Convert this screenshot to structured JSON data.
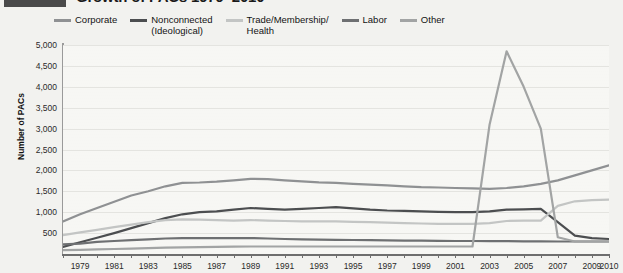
{
  "title_badge_label": "",
  "header": {
    "title": "Growth of PACs 1979–2010"
  },
  "legend": {
    "position": "top",
    "items": [
      {
        "label": "Corporate",
        "color": "#8f9193"
      },
      {
        "label": "Nonconnected\n(Ideological)",
        "color": "#4c4e50"
      },
      {
        "label": "Trade/Membership/\nHealth",
        "color": "#c3c5c4"
      },
      {
        "label": "Labor",
        "color": "#6e7072"
      },
      {
        "label": "Other",
        "color": "#a2a4a4"
      }
    ]
  },
  "chart_data": {
    "type": "line",
    "title": "Growth of PACs 1979–2010",
    "xlabel": "",
    "ylabel": "Number of PACs",
    "ylim": [
      0,
      5000
    ],
    "ytick_step": 500,
    "yticks": [
      500,
      1000,
      1500,
      2000,
      2500,
      3000,
      3500,
      4000,
      4500,
      5000
    ],
    "ytick_labels": [
      "500",
      "1,000",
      "1,500",
      "2,000",
      "2,500",
      "3,000",
      "3,500",
      "4,000",
      "4,500",
      "5,000"
    ],
    "grid": true,
    "legend_position": "top",
    "x": [
      1978,
      1979,
      1980,
      1981,
      1982,
      1983,
      1984,
      1985,
      1986,
      1987,
      1988,
      1989,
      1990,
      1991,
      1992,
      1993,
      1994,
      1995,
      1996,
      1997,
      1998,
      1999,
      2000,
      2001,
      2002,
      2003,
      2004,
      2005,
      2006,
      2007,
      2008,
      2009,
      2010
    ],
    "xtick_labels": [
      "1979",
      "1981",
      "1983",
      "1985",
      "1987",
      "1989",
      "1991",
      "1993",
      "1995",
      "1997",
      "1999",
      "2001",
      "2003",
      "2005",
      "2007",
      "2009",
      "2010"
    ],
    "xtick_values": [
      1979,
      1981,
      1983,
      1985,
      1987,
      1989,
      1991,
      1993,
      1995,
      1997,
      1999,
      2001,
      2003,
      2005,
      2007,
      2009,
      2010
    ],
    "series": [
      {
        "name": "Corporate",
        "color": "#8f9193",
        "values": [
          780,
          950,
          1100,
          1250,
          1400,
          1500,
          1620,
          1700,
          1710,
          1730,
          1760,
          1800,
          1790,
          1760,
          1740,
          1715,
          1700,
          1680,
          1660,
          1640,
          1620,
          1600,
          1590,
          1580,
          1570,
          1560,
          1580,
          1620,
          1680,
          1760,
          1880,
          2000,
          2120
        ]
      },
      {
        "name": "Nonconnected (Ideological)",
        "color": "#4c4e50",
        "values": [
          170,
          280,
          390,
          500,
          620,
          740,
          860,
          950,
          1000,
          1020,
          1060,
          1100,
          1080,
          1060,
          1080,
          1100,
          1120,
          1090,
          1060,
          1040,
          1030,
          1020,
          1010,
          1000,
          1000,
          1020,
          1060,
          1070,
          1080,
          760,
          440,
          380,
          360
        ]
      },
      {
        "name": "Trade/Membership/Health",
        "color": "#c3c5c4",
        "values": [
          450,
          520,
          580,
          640,
          700,
          760,
          810,
          830,
          820,
          810,
          800,
          810,
          800,
          790,
          780,
          780,
          780,
          770,
          760,
          750,
          740,
          730,
          720,
          720,
          720,
          740,
          790,
          800,
          800,
          1150,
          1260,
          1290,
          1300
        ]
      },
      {
        "name": "Labor",
        "color": "#6e7072",
        "values": [
          230,
          250,
          290,
          310,
          330,
          350,
          370,
          380,
          380,
          380,
          380,
          380,
          370,
          360,
          350,
          345,
          340,
          335,
          330,
          325,
          320,
          318,
          315,
          312,
          310,
          308,
          306,
          304,
          302,
          300,
          300,
          300,
          300
        ]
      },
      {
        "name": "Other",
        "color": "#a2a4a4",
        "values": [
          90,
          100,
          110,
          120,
          130,
          140,
          150,
          160,
          165,
          170,
          175,
          180,
          180,
          180,
          180,
          180,
          180,
          180,
          180,
          180,
          180,
          180,
          180,
          180,
          180,
          3100,
          4850,
          4000,
          3000,
          400,
          300,
          300,
          300
        ]
      }
    ],
    "annotations": []
  }
}
